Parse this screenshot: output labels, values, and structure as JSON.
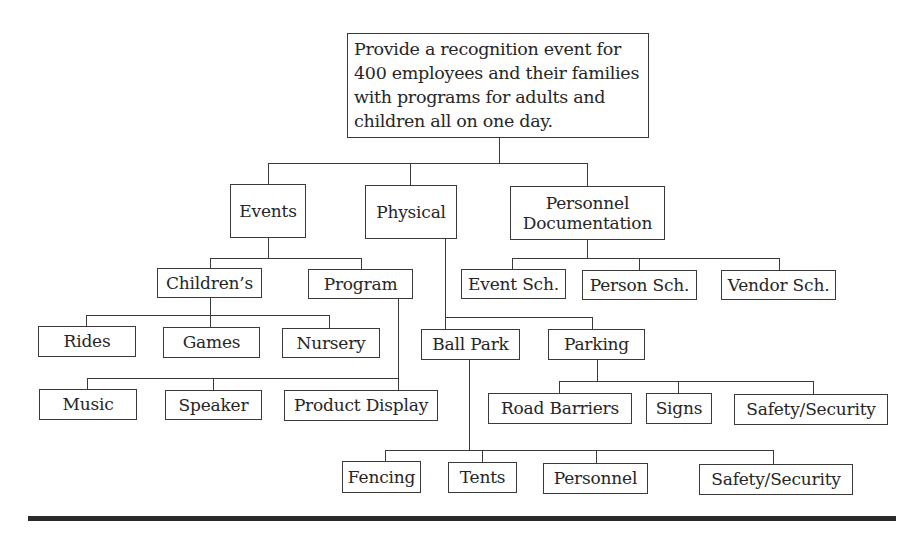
{
  "diagram": {
    "type": "work-breakdown-structure",
    "root": {
      "id": "root",
      "label": "Provide a recognition event for\n400 employees and their families\nwith programs for adults and\nchildren all on one day.",
      "box": [
        347,
        33,
        302,
        105
      ]
    },
    "nodes": [
      {
        "id": "events",
        "label": "Events",
        "parent": "root",
        "box": [
          230,
          184,
          76,
          54
        ]
      },
      {
        "id": "physical",
        "label": "Physical",
        "parent": "root",
        "box": [
          365,
          185,
          92,
          54
        ]
      },
      {
        "id": "personnel-documentation",
        "label": "Personnel\nDocumentation",
        "parent": "root",
        "box": [
          510,
          186,
          155,
          54
        ]
      },
      {
        "id": "childrens",
        "label": "Children’s",
        "parent": "events",
        "box": [
          157,
          268,
          105,
          30
        ]
      },
      {
        "id": "program",
        "label": "Program",
        "parent": "events",
        "box": [
          308,
          269,
          105,
          30
        ]
      },
      {
        "id": "event-sch",
        "label": "Event Sch.",
        "parent": "personnel-documentation",
        "box": [
          461,
          269,
          105,
          30
        ]
      },
      {
        "id": "person-sch",
        "label": "Person Sch.",
        "parent": "personnel-documentation",
        "box": [
          582,
          270,
          115,
          30
        ]
      },
      {
        "id": "vendor-sch",
        "label": "Vendor Sch.",
        "parent": "personnel-documentation",
        "box": [
          721,
          270,
          115,
          30
        ]
      },
      {
        "id": "rides",
        "label": "Rides",
        "parent": "childrens",
        "box": [
          38,
          326,
          98,
          31
        ]
      },
      {
        "id": "games",
        "label": "Games",
        "parent": "childrens",
        "box": [
          163,
          327,
          97,
          31
        ]
      },
      {
        "id": "nursery",
        "label": "Nursery",
        "parent": "childrens",
        "box": [
          282,
          328,
          98,
          30
        ]
      },
      {
        "id": "ball-park",
        "label": "Ball Park",
        "parent": "physical",
        "box": [
          421,
          329,
          99,
          31
        ]
      },
      {
        "id": "parking",
        "label": "Parking",
        "parent": "physical",
        "box": [
          548,
          329,
          97,
          31
        ]
      },
      {
        "id": "music",
        "label": "Music",
        "parent": "program",
        "box": [
          39,
          389,
          98,
          31
        ]
      },
      {
        "id": "speaker",
        "label": "Speaker",
        "parent": "program",
        "box": [
          165,
          390,
          97,
          30
        ]
      },
      {
        "id": "product-display",
        "label": "Product Display",
        "parent": "program",
        "box": [
          284,
          390,
          154,
          31
        ]
      },
      {
        "id": "road-barriers",
        "label": "Road Barriers",
        "parent": "parking",
        "box": [
          488,
          393,
          144,
          31
        ]
      },
      {
        "id": "signs",
        "label": "Signs",
        "parent": "parking",
        "box": [
          646,
          393,
          66,
          31
        ]
      },
      {
        "id": "parking-safety-security",
        "label": "Safety/Security",
        "parent": "parking",
        "box": [
          734,
          394,
          154,
          31
        ]
      },
      {
        "id": "fencing",
        "label": "Fencing",
        "parent": "ball-park",
        "box": [
          342,
          461,
          79,
          32
        ]
      },
      {
        "id": "tents",
        "label": "Tents",
        "parent": "ball-park",
        "box": [
          448,
          462,
          69,
          31
        ]
      },
      {
        "id": "personnel",
        "label": "Personnel",
        "parent": "ball-park",
        "box": [
          543,
          463,
          105,
          31
        ]
      },
      {
        "id": "ballpark-safety-security",
        "label": "Safety/Security",
        "parent": "ball-park",
        "box": [
          699,
          464,
          154,
          31
        ]
      }
    ],
    "connectors": [
      {
        "from": "root",
        "stem": [
          499,
          138,
          163
        ],
        "bar": [
          268,
          587,
          163
        ],
        "drops": [
          [
            268,
            163,
            184
          ],
          [
            410,
            163,
            185
          ],
          [
            587,
            163,
            186
          ]
        ]
      },
      {
        "from": "events",
        "stem": [
          268,
          238,
          258
        ],
        "bar": [
          210,
          361,
          258
        ],
        "drops": [
          [
            210,
            258,
            268
          ],
          [
            361,
            258,
            269
          ]
        ]
      },
      {
        "from": "personnel-documentation",
        "stem": [
          587,
          240,
          258
        ],
        "bar": [
          512,
          779,
          258
        ],
        "drops": [
          [
            512,
            258,
            269
          ],
          [
            639,
            258,
            270
          ],
          [
            779,
            258,
            270
          ]
        ]
      },
      {
        "from": "childrens",
        "stem": [
          210,
          298,
          315
        ],
        "bar": [
          86,
          329,
          315
        ],
        "drops": [
          [
            86,
            315,
            326
          ],
          [
            210,
            315,
            327
          ],
          [
            329,
            315,
            328
          ]
        ]
      },
      {
        "from": "physical",
        "stem": [
          445,
          239,
          317
        ],
        "bar": [
          445,
          592,
          317
        ],
        "drops": [
          [
            445,
            317,
            329
          ],
          [
            592,
            317,
            329
          ]
        ]
      },
      {
        "from": "program",
        "stem": [
          398,
          299,
          378
        ],
        "bar": [
          87,
          398,
          378
        ],
        "drops": [
          [
            87,
            378,
            389
          ],
          [
            213,
            378,
            390
          ],
          [
            398,
            378,
            390
          ]
        ]
      },
      {
        "from": "parking",
        "stem": [
          597,
          360,
          381
        ],
        "bar": [
          559,
          813,
          381
        ],
        "drops": [
          [
            559,
            381,
            393
          ],
          [
            678,
            381,
            393
          ],
          [
            813,
            381,
            394
          ]
        ]
      },
      {
        "from": "ball-park",
        "stem": [
          469,
          360,
          450
        ],
        "bar": [
          385,
          773,
          450
        ],
        "drops": [
          [
            385,
            450,
            461
          ],
          [
            482,
            450,
            462
          ],
          [
            596,
            450,
            463
          ],
          [
            773,
            450,
            464
          ]
        ]
      }
    ],
    "bottom_rule": {
      "x1": 28,
      "x2": 896,
      "y": 516,
      "thickness": 5
    },
    "colors": {
      "line": "#3a3a3a",
      "text": "#262626",
      "rule": "#2a2a2a",
      "background": "#ffffff"
    }
  }
}
